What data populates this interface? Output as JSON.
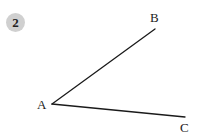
{
  "problem": {
    "number": "2",
    "badge_color": "#d0d0d0"
  },
  "figure": {
    "type": "angle",
    "vertex": {
      "label": "A",
      "x": 52,
      "y": 104
    },
    "rays": [
      {
        "label": "B",
        "x": 155,
        "y": 29
      },
      {
        "label": "C",
        "x": 185,
        "y": 117
      }
    ],
    "line_color": "#1a1a1a",
    "labels": {
      "A": "A",
      "B": "B",
      "C": "C"
    }
  }
}
